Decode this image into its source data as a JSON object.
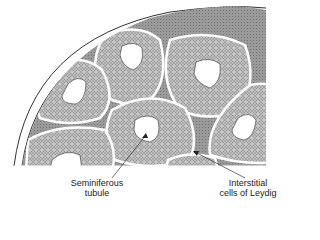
{
  "figure": {
    "type": "histology-diagram",
    "labels": [
      {
        "id": "seminiferous",
        "line1": "Seminiferous",
        "line2": "tubule"
      },
      {
        "id": "leydig",
        "line1": "Interstitial",
        "line2": "cells of Leydig"
      }
    ]
  },
  "colors": {
    "background": "#ffffff",
    "outline": "#333333",
    "tissue_fill": "#bdbdbd",
    "cell_ring": "#555555",
    "lumen": "#ffffff"
  }
}
